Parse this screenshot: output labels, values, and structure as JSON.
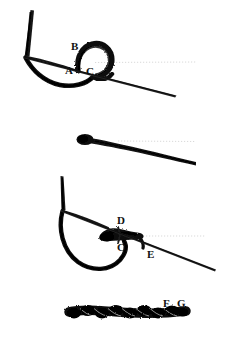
{
  "figure": {
    "background_color": "#ffffff",
    "ink_color": "#111111",
    "thread_color": "#1a1a1a",
    "needle_color": "#2b2b2b",
    "guide_color": "#bdbdbd",
    "panel_count": 4
  },
  "panels": [
    {
      "id": "panel-1",
      "caption": "Loop formed over needle with throw",
      "labels": [
        {
          "key": "B",
          "text": "B",
          "x": 71,
          "y": 41
        },
        {
          "key": "A",
          "text": "A",
          "x": 65,
          "y": 65
        },
        {
          "key": "C",
          "text": "C",
          "x": 86,
          "y": 66
        }
      ]
    },
    {
      "id": "panel-2",
      "caption": "Knot drawn down flat",
      "labels": []
    },
    {
      "id": "panel-3",
      "caption": "Second throw with loop",
      "labels": [
        {
          "key": "D",
          "text": "D",
          "x": 117,
          "y": 215
        },
        {
          "key": "C",
          "text": "C",
          "x": 117,
          "y": 242
        },
        {
          "key": "E",
          "text": "E",
          "x": 147,
          "y": 249
        }
      ]
    },
    {
      "id": "panel-4",
      "caption": "Completed running braided suture line",
      "labels": [
        {
          "key": "F",
          "text": "F",
          "x": 163,
          "y": 298
        },
        {
          "key": "G",
          "text": "G",
          "x": 177,
          "y": 298
        }
      ]
    }
  ],
  "labels_all": [
    "A",
    "B",
    "C",
    "D",
    "E",
    "F",
    "G"
  ]
}
